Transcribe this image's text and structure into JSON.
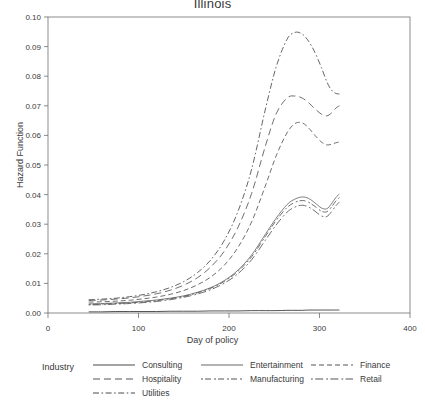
{
  "chart_data": {
    "type": "line",
    "title": "Illinois",
    "xlabel": "Day of policy",
    "ylabel": "Hazard Function",
    "xlim": [
      0,
      400
    ],
    "ylim": [
      0,
      0.1
    ],
    "xticks": [
      0,
      100,
      200,
      300,
      400
    ],
    "yticks": [
      "0.00",
      "0.01",
      "0.02",
      "0.03",
      "0.04",
      "0.05",
      "0.06",
      "0.07",
      "0.08",
      "0.09",
      "0.10"
    ],
    "ytick_values": [
      0,
      0.01,
      0.02,
      0.03,
      0.04,
      0.05,
      0.06,
      0.07,
      0.08,
      0.09,
      0.1
    ],
    "grid": false,
    "legend_title": "Industry",
    "legend_position": "bottom",
    "x": [
      45,
      60,
      75,
      90,
      105,
      120,
      135,
      150,
      165,
      180,
      195,
      210,
      225,
      240,
      252,
      264,
      273,
      281,
      288,
      295,
      302,
      308,
      313,
      318,
      322
    ],
    "series": [
      {
        "name": "Consulting",
        "dash": "solid",
        "values": [
          0.0004,
          0.0004,
          0.0005,
          0.0005,
          0.0005,
          0.0005,
          0.0006,
          0.0006,
          0.0006,
          0.0007,
          0.0007,
          0.0007,
          0.0008,
          0.0008,
          0.0008,
          0.0009,
          0.0009,
          0.0009,
          0.001,
          0.001,
          0.001,
          0.001,
          0.001,
          0.001,
          0.001
        ]
      },
      {
        "name": "Entertainment",
        "dash": "solid-thin",
        "values": [
          0.0031,
          0.0032,
          0.0034,
          0.0036,
          0.004,
          0.0044,
          0.005,
          0.0058,
          0.007,
          0.0086,
          0.011,
          0.0145,
          0.0196,
          0.0265,
          0.032,
          0.0366,
          0.0385,
          0.0392,
          0.0387,
          0.0372,
          0.0355,
          0.0352,
          0.0368,
          0.039,
          0.0402
        ]
      },
      {
        "name": "Finance",
        "dash": "medium-dash",
        "values": [
          0.0037,
          0.0038,
          0.004,
          0.0043,
          0.0048,
          0.0054,
          0.0063,
          0.0076,
          0.0095,
          0.0122,
          0.0162,
          0.0222,
          0.0308,
          0.0428,
          0.053,
          0.0608,
          0.064,
          0.0642,
          0.0625,
          0.06,
          0.0578,
          0.0568,
          0.057,
          0.0575,
          0.0578
        ]
      },
      {
        "name": "Hospitality",
        "dash": "long-dash",
        "values": [
          0.0042,
          0.0044,
          0.0047,
          0.0051,
          0.0057,
          0.0065,
          0.0077,
          0.0094,
          0.0119,
          0.0156,
          0.021,
          0.029,
          0.0404,
          0.0562,
          0.0672,
          0.0726,
          0.0733,
          0.0726,
          0.071,
          0.069,
          0.0672,
          0.0666,
          0.0675,
          0.0692,
          0.07
        ]
      },
      {
        "name": "Manufacturing",
        "dash": "dash-dash",
        "values": [
          0.0029,
          0.003,
          0.0032,
          0.0034,
          0.0037,
          0.0042,
          0.0048,
          0.0056,
          0.0068,
          0.0084,
          0.0107,
          0.0141,
          0.019,
          0.0258,
          0.0312,
          0.0356,
          0.0374,
          0.038,
          0.0374,
          0.036,
          0.0344,
          0.0342,
          0.0357,
          0.0378,
          0.039
        ]
      },
      {
        "name": "Retail",
        "dash": "short-long",
        "values": [
          0.0027,
          0.0028,
          0.003,
          0.0032,
          0.0035,
          0.0039,
          0.0045,
          0.0053,
          0.0064,
          0.0079,
          0.0101,
          0.0133,
          0.018,
          0.0245,
          0.0297,
          0.034,
          0.0358,
          0.0364,
          0.0358,
          0.0344,
          0.0328,
          0.0326,
          0.0341,
          0.0362,
          0.0375
        ]
      },
      {
        "name": "Utilities",
        "dash": "dash-dot",
        "values": [
          0.0045,
          0.0047,
          0.005,
          0.0055,
          0.0062,
          0.0072,
          0.0086,
          0.0106,
          0.0136,
          0.018,
          0.0246,
          0.0344,
          0.0486,
          0.0686,
          0.083,
          0.0924,
          0.0948,
          0.0942,
          0.0918,
          0.088,
          0.083,
          0.0782,
          0.0754,
          0.0742,
          0.074
        ]
      }
    ],
    "legend_columns": [
      [
        "Consulting",
        "Hospitality",
        "Utilities"
      ],
      [
        "Entertainment",
        "Manufacturing"
      ],
      [
        "Finance",
        "Retail"
      ]
    ]
  },
  "colors": {
    "line": "#4a4a4a",
    "axis": "#6f6f6f",
    "text": "#3a3a3a",
    "background": "#ffffff"
  }
}
